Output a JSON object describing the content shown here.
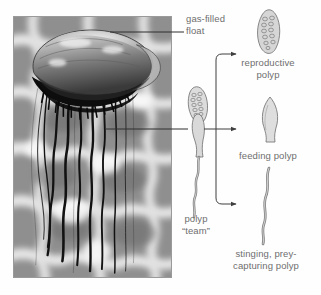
{
  "figure": {
    "kind": "labeled-biology-diagram",
    "background_color": "#ffffff",
    "text_color": "#6e6e6e",
    "line_color": "#4d4d4d"
  },
  "photo": {
    "name": "portuguese-man-o-war-photo",
    "description": "grayscale photograph of a floating siphonophore with a dark gas-filled float and long trailing tentacles over rippled sunlit water",
    "frame_color": "#9a9a9a",
    "water_light": "#efefef",
    "water_mid": "#9b9b9b",
    "water_dark": "#6f6f6f",
    "float_dark": "#141414",
    "float_mid": "#5d5d5d",
    "float_light": "#cfcfcf",
    "tentacle_color": "#131313"
  },
  "labels": {
    "gas_filled_float": "gas-filled\nfloat",
    "polyp_team": "polyp\n“team”",
    "reproductive_polyp": "reproductive\npolyp",
    "feeding_polyp": "feeding polyp",
    "stinging_polyp": "stinging, prey-\ncapturing polyp"
  },
  "illustrations": {
    "polyp_team": {
      "name": "polyp-team-illustration",
      "parts": [
        "reproductive polyp cluster",
        "feeding polyp",
        "stinging tentacle"
      ],
      "outline_color": "#6a6a6a",
      "fill_color": "#d6d6d6"
    },
    "reproductive_polyp": {
      "name": "reproductive-polyp-illustration",
      "shape": "elongated segmented grape-like cluster",
      "outline_color": "#6a6a6a",
      "fill_color": "#d2d2d2"
    },
    "feeding_polyp": {
      "name": "feeding-polyp-illustration",
      "shape": "tapered flask with pointed tip and narrow stalk",
      "outline_color": "#7a7a7a",
      "fill_color": "#dcdcdc"
    },
    "stinging_polyp": {
      "name": "stinging-polyp-illustration",
      "shape": "long wavy beaded tentacle",
      "outline_color": "#7d7d7d",
      "fill_color": "#c9c9c9"
    }
  },
  "connectors": {
    "gas_float_leader": "horizontal leader line from the float in the photo to the gas-filled float label",
    "polyp_leader": "horizontal leader line from the tentacle region in the photo to the polyp team illustration",
    "bracket": "vertical bracket fanning out to three arrowheads pointing at the reproductive, feeding and stinging polyps"
  }
}
